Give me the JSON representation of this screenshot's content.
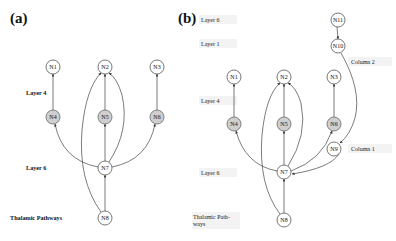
{
  "panels": [
    {
      "label": "(a)",
      "layer_labels": [
        "Layer 4",
        "Layer 6",
        "Thalamic Pathways"
      ],
      "nodes": [
        "N1",
        "N2",
        "N3",
        "N4",
        "N5",
        "N6",
        "N7",
        "N8"
      ],
      "grey_nodes": [
        "N4",
        "N5",
        "N6"
      ],
      "edges": [
        [
          "N4",
          "N1"
        ],
        [
          "N5",
          "N2"
        ],
        [
          "N6",
          "N3"
        ],
        [
          "N7",
          "N4"
        ],
        [
          "N7",
          "N5"
        ],
        [
          "N7",
          "N6"
        ],
        [
          "N7",
          "N2"
        ],
        [
          "N8",
          "N7"
        ],
        [
          "N8",
          "N2"
        ]
      ]
    },
    {
      "label": "(b)",
      "layer_labels": [
        "Layer 6",
        "Layer 1",
        "Layer 4",
        "Layer 6",
        "Thalamic Path-",
        "ways"
      ],
      "column_labels": [
        "Column 2",
        "Column 1"
      ],
      "nodes": [
        "N1",
        "N2",
        "N3",
        "N4",
        "N5",
        "N6",
        "N7",
        "N8",
        "N9",
        "N10",
        "N11"
      ],
      "grey_nodes": [
        "N4",
        "N5",
        "N6"
      ],
      "edges": [
        [
          "N11",
          "N10"
        ],
        [
          "N10",
          "N9"
        ],
        [
          "N4",
          "N1"
        ],
        [
          "N5",
          "N2"
        ],
        [
          "N6",
          "N3"
        ],
        [
          "N7",
          "N4"
        ],
        [
          "N7",
          "N5"
        ],
        [
          "N7",
          "N6"
        ],
        [
          "N7",
          "N2"
        ],
        [
          "N9",
          "N6"
        ],
        [
          "N9",
          "N7"
        ],
        [
          "N8",
          "N7"
        ],
        [
          "N8",
          "N2"
        ]
      ]
    }
  ]
}
